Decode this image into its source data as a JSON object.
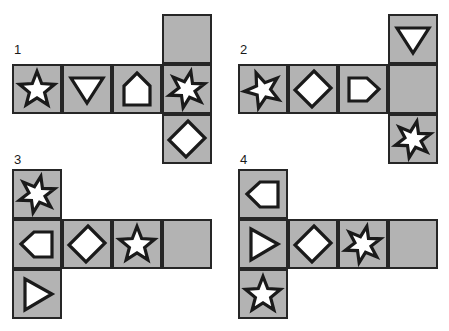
{
  "page": {
    "background_color": "#ffffff",
    "cell_fill_color": "#b3b3b3",
    "cell_border_color": "#262626",
    "shape_fill_color": "#ffffff",
    "shape_stroke_color": "#1a1a1a",
    "cell_size_px": 50
  },
  "nets": [
    {
      "label": "1",
      "label_x": 14,
      "label_y": 43,
      "origin_x": 12,
      "origin_y": 14,
      "cells": [
        {
          "col": 3,
          "row": 0,
          "shape": "empty",
          "name": "net1-cell-top"
        },
        {
          "col": 0,
          "row": 1,
          "shape": "star5-up",
          "name": "net1-cell-row-1"
        },
        {
          "col": 1,
          "row": 1,
          "shape": "triangle-down",
          "name": "net1-cell-row-2"
        },
        {
          "col": 2,
          "row": 1,
          "shape": "pentagon-up",
          "name": "net1-cell-row-3"
        },
        {
          "col": 3,
          "row": 1,
          "shape": "star6",
          "name": "net1-cell-row-4"
        },
        {
          "col": 3,
          "row": 2,
          "shape": "parallelogram",
          "name": "net1-cell-bottom"
        }
      ]
    },
    {
      "label": "2",
      "label_x": 240,
      "label_y": 43,
      "origin_x": 238,
      "origin_y": 14,
      "cells": [
        {
          "col": 3,
          "row": 0,
          "shape": "triangle-down",
          "name": "net2-cell-top"
        },
        {
          "col": 0,
          "row": 1,
          "shape": "star5-left",
          "name": "net2-cell-row-1"
        },
        {
          "col": 1,
          "row": 1,
          "shape": "parallelogram",
          "name": "net2-cell-row-2"
        },
        {
          "col": 2,
          "row": 1,
          "shape": "pentagon-right",
          "name": "net2-cell-row-3"
        },
        {
          "col": 3,
          "row": 1,
          "shape": "empty",
          "name": "net2-cell-row-4"
        },
        {
          "col": 3,
          "row": 2,
          "shape": "star6",
          "name": "net2-cell-bottom"
        }
      ]
    },
    {
      "label": "3",
      "label_x": 14,
      "label_y": 153,
      "origin_x": 12,
      "origin_y": 169,
      "cells": [
        {
          "col": 0,
          "row": 0,
          "shape": "star6",
          "name": "net3-cell-top"
        },
        {
          "col": 0,
          "row": 1,
          "shape": "pentagon-left",
          "name": "net3-cell-row-1"
        },
        {
          "col": 1,
          "row": 1,
          "shape": "parallelogram",
          "name": "net3-cell-row-2"
        },
        {
          "col": 2,
          "row": 1,
          "shape": "star5-up",
          "name": "net3-cell-row-3"
        },
        {
          "col": 3,
          "row": 1,
          "shape": "empty",
          "name": "net3-cell-row-4"
        },
        {
          "col": 0,
          "row": 2,
          "shape": "triangle-right",
          "name": "net3-cell-bottom"
        }
      ]
    },
    {
      "label": "4",
      "label_x": 240,
      "label_y": 153,
      "origin_x": 238,
      "origin_y": 169,
      "cells": [
        {
          "col": 0,
          "row": 0,
          "shape": "pentagon-left",
          "name": "net4-cell-top"
        },
        {
          "col": 0,
          "row": 1,
          "shape": "triangle-right",
          "name": "net4-cell-row-1"
        },
        {
          "col": 1,
          "row": 1,
          "shape": "parallelogram",
          "name": "net4-cell-row-2"
        },
        {
          "col": 2,
          "row": 1,
          "shape": "star6",
          "name": "net4-cell-row-3"
        },
        {
          "col": 3,
          "row": 1,
          "shape": "empty",
          "name": "net4-cell-row-4"
        },
        {
          "col": 0,
          "row": 2,
          "shape": "star5-up",
          "name": "net4-cell-bottom"
        }
      ]
    }
  ],
  "shape_glyph_names": {
    "star5-up": "five-point-star-icon",
    "star5-left": "five-point-star-tilted-icon",
    "star6": "six-point-star-icon",
    "triangle-down": "triangle-down-icon",
    "triangle-right": "triangle-right-icon",
    "pentagon-up": "pentagon-up-icon",
    "pentagon-left": "pentagon-left-icon",
    "pentagon-right": "pentagon-right-icon",
    "parallelogram": "parallelogram-icon",
    "empty": "blank-face-icon"
  }
}
